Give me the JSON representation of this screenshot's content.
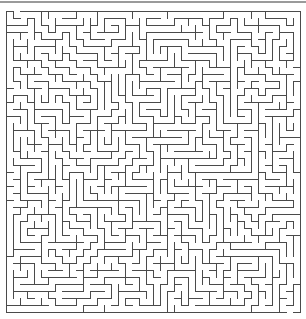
{
  "maze": {
    "cols": 42,
    "rows": 43,
    "cell": 7,
    "origin_x": 6,
    "origin_y": 11,
    "wall_color": "#4a4a4a",
    "seed": 1337,
    "entrance": {
      "side": "top",
      "col": 1
    },
    "exit": {
      "side": "bottom",
      "col": 40
    }
  },
  "top_bar": {
    "color": "#9a9a9a"
  }
}
